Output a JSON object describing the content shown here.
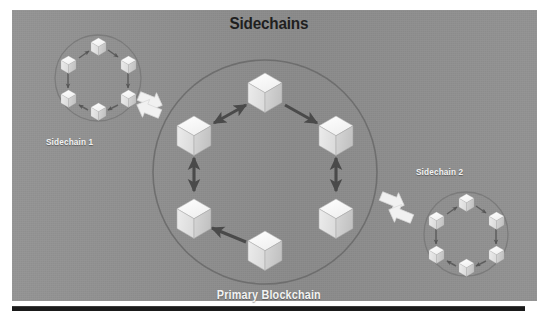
{
  "figure": {
    "title": "Sidechains",
    "caption_primary": "Primary Blockchain",
    "label_sidechain_1": "Sidechain 1",
    "label_sidechain_2": "Sidechain 2",
    "background_color": "#8e8e8e",
    "title_color": "#1f1f1f",
    "label_color": "#f2f2f2",
    "rule_color": "#1a1a1a"
  },
  "diagram": {
    "type": "blockchain-sidechain-diagram",
    "primary_chain": {
      "name": "Primary Blockchain",
      "circle": {
        "cx": 265,
        "cy": 172,
        "r": 112
      },
      "ring_stroke": "#6f6f6f",
      "node_count": 6,
      "node_label": "block-cube",
      "nodes": [
        {
          "id": "p1",
          "cx": 265,
          "cy": 90,
          "size": 34,
          "position": "top"
        },
        {
          "id": "p2",
          "cx": 194,
          "cy": 133,
          "size": 34,
          "position": "upper-left"
        },
        {
          "id": "p3",
          "cx": 336,
          "cy": 133,
          "size": 34,
          "position": "upper-right"
        },
        {
          "id": "p4",
          "cx": 194,
          "cy": 216,
          "size": 34,
          "position": "lower-left"
        },
        {
          "id": "p5",
          "cx": 336,
          "cy": 216,
          "size": 34,
          "position": "lower-right"
        },
        {
          "id": "p6",
          "cx": 265,
          "cy": 251,
          "size": 34,
          "position": "bottom"
        }
      ],
      "connections": [
        {
          "from": "p1",
          "to": "p2",
          "arrow": "both",
          "style": "diagonal"
        },
        {
          "from": "p1",
          "to": "p3",
          "arrow": "to",
          "style": "diagonal"
        },
        {
          "from": "p2",
          "to": "p4",
          "arrow": "both",
          "style": "vertical"
        },
        {
          "from": "p3",
          "to": "p5",
          "arrow": "both",
          "style": "vertical"
        },
        {
          "from": "p6",
          "to": "p4",
          "arrow": "to",
          "style": "diagonal"
        }
      ],
      "arrow_color": "#4a4a4a"
    },
    "sidechains": [
      {
        "name": "Sidechain 1",
        "circle": {
          "cx": 98,
          "cy": 78,
          "r": 43
        },
        "ring_stroke": "#7d7d7d",
        "node_count": 6,
        "nodes": [
          {
            "id": "s1a",
            "cx": 98,
            "cy": 45,
            "size": 15
          },
          {
            "id": "s1b",
            "cx": 68,
            "cy": 63,
            "size": 15
          },
          {
            "id": "s1c",
            "cx": 128,
            "cy": 63,
            "size": 15
          },
          {
            "id": "s1d",
            "cx": 68,
            "cy": 97,
            "size": 15
          },
          {
            "id": "s1e",
            "cx": 128,
            "cy": 97,
            "size": 15
          },
          {
            "id": "s1f",
            "cx": 98,
            "cy": 110,
            "size": 15
          }
        ],
        "connector_color": "#5e5e5e"
      },
      {
        "name": "Sidechain 2",
        "circle": {
          "cx": 466,
          "cy": 234,
          "r": 42
        },
        "ring_stroke": "#7d7d7d",
        "node_count": 6,
        "nodes": [
          {
            "id": "s2a",
            "cx": 466,
            "cy": 201,
            "size": 15
          },
          {
            "id": "s2b",
            "cx": 436,
            "cy": 219,
            "size": 15
          },
          {
            "id": "s2c",
            "cx": 496,
            "cy": 219,
            "size": 15
          },
          {
            "id": "s2d",
            "cx": 436,
            "cy": 253,
            "size": 15
          },
          {
            "id": "s2e",
            "cx": 496,
            "cy": 253,
            "size": 15
          },
          {
            "id": "s2f",
            "cx": 466,
            "cy": 266,
            "size": 15
          }
        ],
        "connector_color": "#5e5e5e"
      }
    ],
    "peg_arrows": [
      {
        "id": "peg-left",
        "between": [
          "Sidechain 1",
          "Primary Blockchain"
        ],
        "direction": "bidirectional",
        "color": "#f0f0f0"
      },
      {
        "id": "peg-right",
        "between": [
          "Primary Blockchain",
          "Sidechain 2"
        ],
        "direction": "bidirectional",
        "color": "#f0f0f0"
      }
    ],
    "cube_faces": {
      "top": "#fbfbfb",
      "left": "#e4e4e4",
      "right": "#cfcfcf",
      "outline": "#a9a9a9"
    }
  }
}
